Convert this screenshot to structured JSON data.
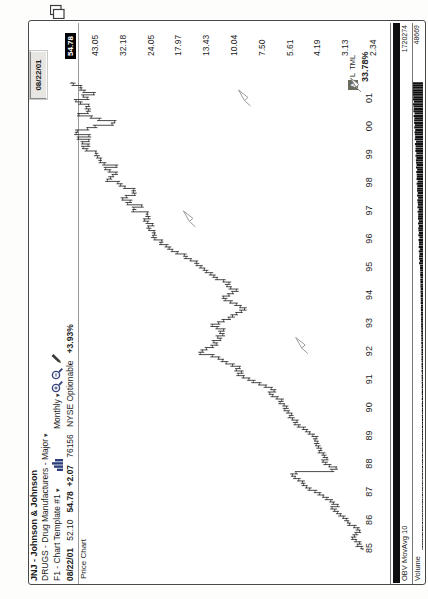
{
  "window": {
    "date_box": "08/22/01",
    "copy_icon": "copy-pages-icon"
  },
  "header": {
    "title": "JNJ - Johnson & Johnson",
    "sector": "DRUGS - Drug Manufacturers - Major",
    "template": "F1 - Chart Template #1",
    "period": "Monthly",
    "quote": {
      "date": "08/22/01",
      "open": "52.10",
      "last": "54.78",
      "change": "+2.07",
      "volume": "76156",
      "exchange": "NYSE Optionable",
      "pct_change": "+3.93%"
    },
    "pane_label": "Price Chart"
  },
  "bottom_right": {
    "a_button": "A",
    "l_button": "L",
    "tml_button": "TML",
    "period_pct": "33.78%"
  },
  "obv_pane": {
    "label": "OBV MovAvg 10",
    "value": "1720274"
  },
  "volume_pane": {
    "label": "Volume",
    "value": "48669"
  },
  "chart_data": {
    "type": "bar",
    "subtype": "monthly-ohlc",
    "scale": "log",
    "x_years": [
      "85",
      "86",
      "87",
      "88",
      "89",
      "90",
      "91",
      "92",
      "93",
      "94",
      "95",
      "96",
      "97",
      "98",
      "99",
      "00",
      "01"
    ],
    "y_axis_labels": [
      "43.05",
      "32.18",
      "24.05",
      "17.97",
      "13.43",
      "10.04",
      "7.50",
      "5.61",
      "4.19",
      "3.13",
      "2.34"
    ],
    "y_axis_values": [
      43.05,
      32.18,
      24.05,
      17.97,
      13.43,
      10.04,
      7.5,
      5.61,
      4.19,
      3.13,
      2.34
    ],
    "last_price": 54.78,
    "start": "1985-01",
    "end": "2001-08",
    "monthly_closes": [
      2.65,
      2.75,
      2.7,
      2.8,
      2.9,
      2.85,
      2.8,
      2.7,
      2.75,
      2.85,
      3.0,
      3.05,
      3.1,
      3.2,
      3.3,
      3.4,
      3.5,
      3.6,
      3.4,
      3.55,
      3.65,
      3.8,
      3.95,
      4.1,
      4.3,
      4.55,
      4.7,
      4.85,
      4.9,
      5.1,
      5.3,
      5.45,
      5.25,
      3.6,
      3.45,
      3.7,
      3.85,
      3.95,
      3.8,
      3.9,
      3.95,
      4.1,
      4.05,
      4.15,
      4.25,
      4.2,
      4.3,
      4.25,
      4.4,
      4.55,
      4.7,
      4.85,
      5.1,
      5.3,
      5.2,
      5.45,
      5.6,
      5.5,
      5.7,
      5.9,
      5.8,
      5.95,
      6.2,
      6.1,
      6.4,
      6.7,
      6.9,
      6.6,
      6.8,
      7.2,
      7.7,
      8.2,
      8.6,
      9.1,
      9.6,
      9.3,
      9.8,
      9.5,
      10.2,
      10.9,
      11.3,
      11.8,
      12.6,
      14.3,
      14.0,
      13.4,
      12.6,
      12.1,
      12.4,
      11.6,
      11.9,
      11.3,
      11.6,
      11.2,
      12.0,
      12.6,
      11.8,
      11.2,
      10.6,
      10.2,
      9.8,
      9.3,
      9.0,
      9.4,
      9.8,
      10.4,
      11.0,
      11.2,
      10.6,
      10.2,
      9.8,
      10.4,
      10.8,
      10.6,
      11.2,
      12.0,
      12.4,
      12.8,
      13.4,
      13.7,
      14.2,
      14.8,
      14.9,
      15.8,
      16.6,
      16.9,
      18.2,
      19.2,
      19.8,
      20.4,
      21.6,
      21.4,
      23.0,
      23.4,
      23.1,
      23.2,
      24.4,
      24.6,
      23.6,
      24.8,
      25.6,
      24.6,
      24.9,
      24.9,
      28.8,
      28.6,
      26.4,
      30.6,
      29.8,
      32.2,
      31.0,
      28.4,
      28.8,
      28.7,
      31.5,
      32.9,
      33.9,
      37.8,
      36.6,
      35.7,
      34.6,
      36.9,
      38.5,
      34.5,
      39.1,
      40.7,
      40.6,
      41.9,
      42.5,
      42.7,
      46.9,
      48.7,
      46.3,
      49.0,
      46.0,
      51.2,
      45.9,
      52.4,
      51.8,
      46.6,
      43.0,
      36.0,
      35.1,
      41.2,
      44.8,
      50.9,
      46.5,
      46.0,
      47.0,
      46.1,
      50.1,
      52.5,
      46.7,
      48.6,
      43.7,
      48.3,
      49.8,
      50.0,
      54.0,
      54.78
    ],
    "flag_markers": [
      {
        "year": 2001.0,
        "price": 9.1
      },
      {
        "year": 1996.7,
        "price": 16.2
      },
      {
        "year": 1992.2,
        "price": 5.0
      }
    ],
    "indicator_panes": [
      {
        "name": "OBV MovAvg 10",
        "right_value": 1720274,
        "appearance": "flat dark strip"
      },
      {
        "name": "Volume",
        "right_value": 48669,
        "appearance": "histogram, tall at right"
      }
    ]
  }
}
